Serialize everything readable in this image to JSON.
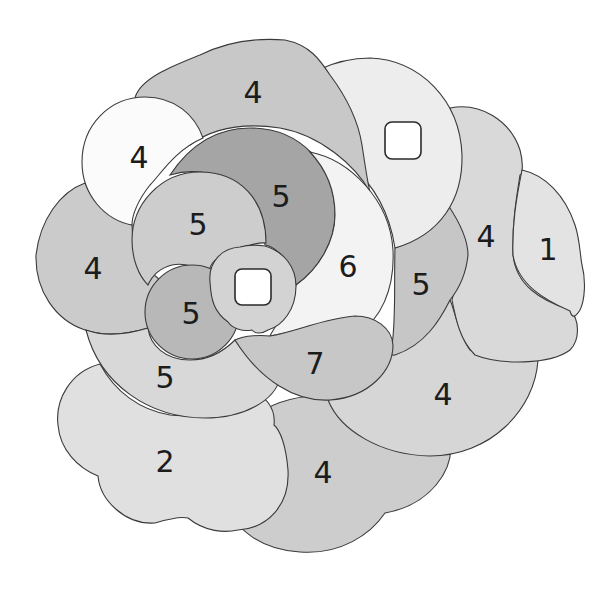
{
  "puzzle": {
    "title": "",
    "type": "shade-by-number region puzzle",
    "colors": {
      "background": "#ffffff",
      "outline": "#3a3a3a",
      "text": "#1c1c1c",
      "shades": {
        "white": "#fbfbfb",
        "very_light": "#ececec",
        "light": "#dcdcdc",
        "mid_light": "#cfcfcf",
        "mid": "#c3c3c3",
        "mid_dark": "#b4b4b4",
        "dark": "#a2a2a2"
      }
    },
    "regions": [
      {
        "id": "r-bottom-4",
        "label": "4",
        "fill": "#cdcdcd"
      },
      {
        "id": "r-cloud-2",
        "label": "2",
        "fill": "#e0e0e0"
      },
      {
        "id": "r-right-lower-4",
        "label": "4",
        "fill": "#d6d6d6"
      },
      {
        "id": "r-far-right-1",
        "label": "1",
        "fill": "#e3e3e3"
      },
      {
        "id": "r-right-4",
        "label": "4",
        "fill": "#d9d9d9"
      },
      {
        "id": "r-right-5",
        "label": "5",
        "fill": "#c6c6c6"
      },
      {
        "id": "r-top-right-blank",
        "label": "",
        "fill": "#ededed"
      },
      {
        "id": "r-top-4",
        "label": "4",
        "fill": "#c8c8c8"
      },
      {
        "id": "r-left-4",
        "label": "4",
        "fill": "#cbcbcb"
      },
      {
        "id": "r-lower-left-5",
        "label": "5",
        "fill": "#d8d8d8"
      },
      {
        "id": "r-white-4",
        "label": "4",
        "fill": "#fbfbfb"
      },
      {
        "id": "r-dark-5",
        "label": "5",
        "fill": "#a5a5a5"
      },
      {
        "id": "r-crescent-6",
        "label": "6",
        "fill": "#f3f3f3"
      },
      {
        "id": "r-mid-5",
        "label": "5",
        "fill": "#cdcdcd"
      },
      {
        "id": "r-small-5",
        "label": "5",
        "fill": "#b8b8b8"
      },
      {
        "id": "r-tail-7",
        "label": "7",
        "fill": "#c7c7c7"
      },
      {
        "id": "r-center-blank",
        "label": "",
        "fill": "#d3d3d3"
      }
    ]
  }
}
